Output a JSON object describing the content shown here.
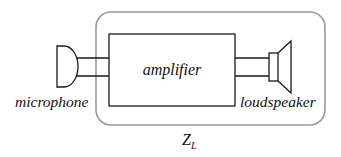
{
  "diagram": {
    "type": "block-diagram",
    "boundary": {
      "label": "Z",
      "label_subscript": "L",
      "stroke": "#9a9a9a"
    },
    "blocks": [
      {
        "id": "amplifier",
        "label": "amplifier"
      }
    ],
    "components": [
      {
        "id": "microphone",
        "label": "microphone"
      },
      {
        "id": "loudspeaker",
        "label": "loudspeaker"
      }
    ],
    "connections": [
      {
        "from": "microphone",
        "to": "amplifier",
        "wires": 2
      },
      {
        "from": "amplifier",
        "to": "loudspeaker",
        "wires": 2
      }
    ],
    "colors": {
      "line": "#1a1a1a",
      "boundary": "#9a9a9a",
      "background": "#ffffff"
    }
  }
}
